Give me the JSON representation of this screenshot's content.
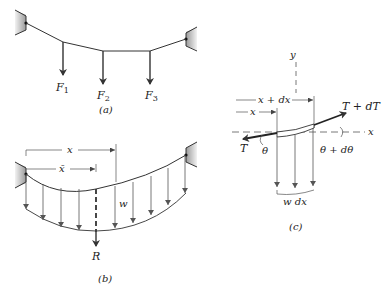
{
  "figure_a": {
    "caption": "(a)",
    "forces": [
      {
        "symbol": "F",
        "subscript": "1"
      },
      {
        "symbol": "F",
        "subscript": "2"
      },
      {
        "symbol": "F",
        "subscript": "3"
      }
    ]
  },
  "figure_b": {
    "caption": "(b)",
    "dimension_x": "x",
    "dimension_xbar": "x̄",
    "load_label": "w",
    "resultant_label": "R"
  },
  "figure_c": {
    "caption": "(c)",
    "axis_y": "y",
    "axis_x": "x",
    "dim_x_plus_dx": "x + dx",
    "dim_x": "x",
    "tension_left": "T",
    "tension_right": "T + dT",
    "angle_left": "θ",
    "angle_right": "θ + dθ",
    "load_element": "w dx"
  },
  "colors": {
    "line": "#333333",
    "support": "#bbbbbb"
  }
}
